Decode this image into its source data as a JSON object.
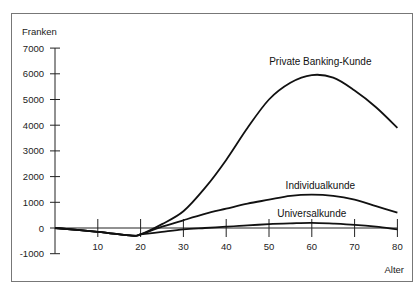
{
  "chart_data": {
    "type": "line",
    "title": "",
    "ylabel": "Franken",
    "xlabel": "Alter",
    "xlim": [
      0,
      80
    ],
    "ylim": [
      -1000,
      7000
    ],
    "x_ticks": [
      10,
      20,
      30,
      40,
      50,
      60,
      70,
      80
    ],
    "y_ticks": [
      7000,
      6000,
      5000,
      4000,
      3000,
      2000,
      1000,
      0,
      -1000
    ],
    "grid": false,
    "legend": "inline labels",
    "series": [
      {
        "name": "Private Banking-Kunde",
        "x": [
          0,
          10,
          18,
          20,
          25,
          30,
          35,
          40,
          45,
          50,
          55,
          60,
          65,
          70,
          75,
          80
        ],
        "values": [
          0,
          -150,
          -300,
          -250,
          150,
          650,
          1550,
          2650,
          3900,
          5000,
          5650,
          5950,
          5850,
          5350,
          4700,
          3900
        ],
        "label_pos": {
          "x": 62,
          "y": 6350
        }
      },
      {
        "name": "Individualkunde",
        "x": [
          0,
          10,
          18,
          20,
          25,
          30,
          35,
          40,
          45,
          50,
          55,
          60,
          65,
          70,
          75,
          80
        ],
        "values": [
          0,
          -150,
          -300,
          -250,
          50,
          300,
          550,
          750,
          950,
          1100,
          1250,
          1300,
          1250,
          1100,
          850,
          600
        ],
        "label_pos": {
          "x": 62,
          "y": 1500
        }
      },
      {
        "name": "Universalkunde",
        "x": [
          0,
          10,
          18,
          20,
          25,
          30,
          35,
          40,
          45,
          50,
          55,
          60,
          65,
          70,
          75,
          80
        ],
        "values": [
          0,
          -150,
          -300,
          -250,
          -150,
          -50,
          0,
          50,
          100,
          150,
          180,
          200,
          170,
          120,
          50,
          -50
        ],
        "label_pos": {
          "x": 60,
          "y": 430
        }
      }
    ]
  }
}
